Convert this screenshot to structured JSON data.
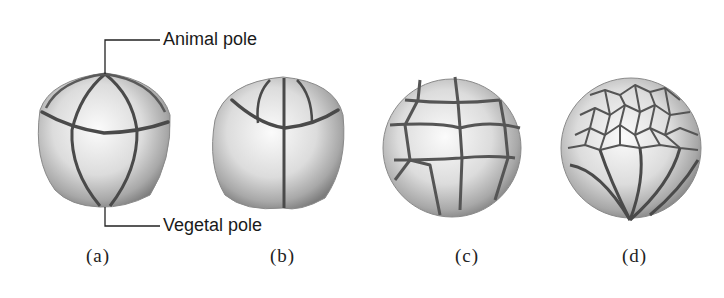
{
  "figure": {
    "labels": {
      "animal_pole": "Animal pole",
      "vegetal_pole": "Vegetal pole"
    },
    "stages": [
      {
        "id": "a",
        "caption": "(a)",
        "description": "8-cell stage, side view with animal and vegetal poles"
      },
      {
        "id": "b",
        "caption": "(b)",
        "description": "8-cell stage, rotated view"
      },
      {
        "id": "c",
        "caption": "(c)",
        "description": "Morula-like stage with many cells"
      },
      {
        "id": "d",
        "caption": "(d)",
        "description": "Blastula with small animal cells and large vegetal cells"
      }
    ],
    "colors": {
      "cell_light": "#f4f4f4",
      "cell_mid": "#c8c8c8",
      "cell_dark": "#8a8a8a",
      "furrow": "#4a4a4a",
      "text": "#1a1a1a"
    }
  }
}
